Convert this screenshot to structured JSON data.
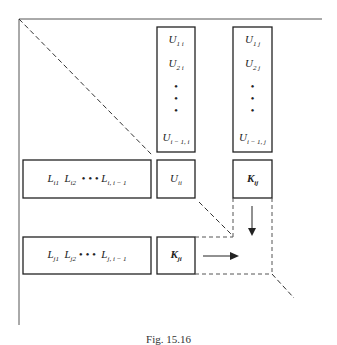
{
  "diagram": {
    "column_i": {
      "entries": [
        "U1i",
        "U2i",
        "•",
        "•",
        "•",
        "Ui−1,i"
      ]
    },
    "column_j": {
      "entries": [
        "U1j",
        "U2j",
        "•",
        "•",
        "•",
        "Ui−1,j"
      ]
    },
    "row_i": {
      "text": "Li1  Li2  • • •  Li, i−1"
    },
    "diag_ii": {
      "text": "Uii"
    },
    "k_ij": {
      "text": "Kij"
    },
    "row_j": {
      "text": "Lj1  Lj2 • • •  Lj, i−1"
    },
    "k_ji": {
      "text": "Kji"
    },
    "caption": "Fig. 15.16"
  }
}
